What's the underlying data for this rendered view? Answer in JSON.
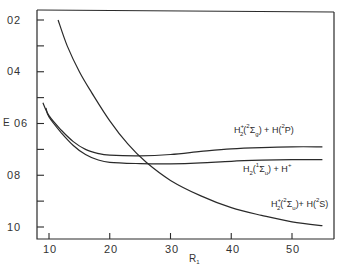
{
  "chart_data": {
    "type": "line",
    "title": "",
    "xlabel": "R1",
    "ylabel": "E",
    "xlim": [
      8,
      57
    ],
    "ylim": [
      1.04,
      0.17
    ],
    "y_inverted": true,
    "grid": false,
    "x_ticks": [
      10,
      20,
      30,
      40,
      50
    ],
    "x_tick_labels": [
      "10",
      "20",
      "30",
      "40",
      "50"
    ],
    "y_ticks": [
      0.2,
      0.3,
      0.4,
      0.5,
      0.6,
      0.7,
      0.8,
      0.9,
      1.0
    ],
    "y_tick_labels": [
      "02",
      "04",
      "06",
      "08",
      "10"
    ],
    "series": [
      {
        "name": "H2+(2Σg) + H(2P)",
        "label_parts": {
          "base": "H",
          "sub": "2",
          "sup": "+",
          "state_sup": "2",
          "state": "Σ",
          "state_sub": "g",
          "plus": " + H(",
          "atom_sup": "2",
          "atom": "P)"
        },
        "x": [
          9,
          10,
          12,
          14,
          16,
          18,
          20,
          25,
          30,
          35,
          40,
          45,
          50,
          55
        ],
        "y": [
          0.52,
          0.57,
          0.625,
          0.67,
          0.7,
          0.715,
          0.722,
          0.725,
          0.72,
          0.708,
          0.698,
          0.693,
          0.69,
          0.69
        ]
      },
      {
        "name": "H2(1Σu) + H+",
        "label_parts": {
          "base": "H",
          "sub": "2",
          "state_sup": "1",
          "state": "Σ",
          "state_sub": "u",
          "plus": " + H",
          "atom_sup": "+"
        },
        "x": [
          9.5,
          10,
          12,
          14,
          16,
          18,
          20,
          25,
          30,
          35,
          40,
          45,
          50,
          55
        ],
        "y": [
          0.54,
          0.575,
          0.635,
          0.685,
          0.72,
          0.74,
          0.75,
          0.755,
          0.756,
          0.752,
          0.746,
          0.742,
          0.74,
          0.74
        ]
      },
      {
        "name": "H2+(2Σu) + H(2S)",
        "label_parts": {
          "base": "H",
          "sub": "2",
          "sup": "+",
          "state_sup": "2",
          "state": "Σ",
          "state_sub": "u",
          "plus": " + H(",
          "atom_sup": "2",
          "atom": "S)"
        },
        "x": [
          11.5,
          13,
          15,
          17,
          20,
          23,
          26,
          30,
          35,
          40,
          45,
          50,
          55
        ],
        "y": [
          0.2,
          0.3,
          0.4,
          0.48,
          0.59,
          0.68,
          0.75,
          0.82,
          0.88,
          0.925,
          0.955,
          0.98,
          0.995
        ]
      }
    ]
  },
  "labels": {
    "y_axis": "E",
    "x_axis_main": "R",
    "x_axis_sub": "1",
    "yticks": [
      "02",
      "04",
      "06",
      "08",
      "10"
    ],
    "xticks": [
      "10",
      "20",
      "30",
      "40",
      "50"
    ],
    "curve_upper": {
      "h": "H",
      "sup": "+",
      "sub": "2",
      "open": "(",
      "ssup": "2",
      "sigma": "Σ",
      "ssub": "g",
      "mid": ") + H(",
      "asup": "2",
      "atom": "P)"
    },
    "curve_middle": {
      "h": "H",
      "sub": "2",
      "open": "(",
      "ssup": "1",
      "sigma": "Σ",
      "ssub": "u",
      "mid": ") + H",
      "asup": "+"
    },
    "curve_lower": {
      "h": "H",
      "sup": "+",
      "sub": "2",
      "open": "(",
      "ssup": "2",
      "sigma": "Σ",
      "ssub": "u",
      "mid": ")+ H(",
      "asup": "2",
      "atom": "S)"
    }
  },
  "colors": {
    "ink": "#2a2a2a",
    "background": "#ffffff"
  }
}
